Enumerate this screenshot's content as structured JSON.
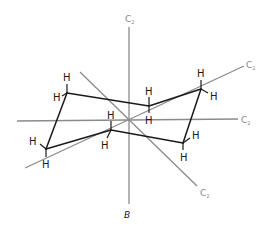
{
  "figure": {
    "caption": "B",
    "axes": [
      {
        "id": "vertical",
        "label": "C",
        "subscript": "2"
      },
      {
        "id": "upper-diagonal",
        "label": "C",
        "subscript": "2"
      },
      {
        "id": "horizontal",
        "label": "C",
        "subscript": "2"
      },
      {
        "id": "lower-diagonal",
        "label": "C",
        "subscript": "2"
      }
    ],
    "atom_symbol": "H",
    "atoms": {
      "h1": "H",
      "h2": "H",
      "h3": "H",
      "h4": "H",
      "h5": "H",
      "h6": "H",
      "h7": "H",
      "h8": "H",
      "h9": "H",
      "h10": "H",
      "h11": "H",
      "h12": "H"
    },
    "colors": {
      "axis": "#8a8a8a",
      "bond": "#1a1a1a",
      "background": "#ffffff"
    }
  }
}
